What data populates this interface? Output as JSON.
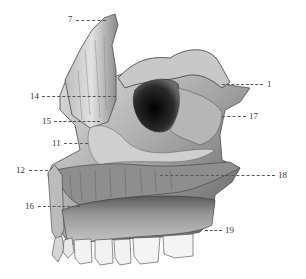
{
  "figure": {
    "colors": {
      "background": "#ffffff",
      "bone_light": "#d8d8d8",
      "bone_mid": "#9a9a9a",
      "bone_dark": "#3a3a3a",
      "cavity": "#111111",
      "teeth": "#f2f2f2",
      "label_text": "#333333",
      "leader": "#555555"
    }
  },
  "labels": [
    {
      "id": "7",
      "text": "7",
      "x": 68,
      "y": 15,
      "line_x1": 76,
      "line_x2": 106,
      "line_y": 20
    },
    {
      "id": "14",
      "text": "14",
      "x": 30,
      "y": 92,
      "line_x1": 42,
      "line_x2": 116,
      "line_y": 96
    },
    {
      "id": "15",
      "text": "15",
      "x": 42,
      "y": 117,
      "line_x1": 54,
      "line_x2": 100,
      "line_y": 121
    },
    {
      "id": "11",
      "text": "11",
      "x": 52,
      "y": 139,
      "line_x1": 64,
      "line_x2": 88,
      "line_y": 143
    },
    {
      "id": "12",
      "text": "12",
      "x": 16,
      "y": 166,
      "line_x1": 29,
      "line_x2": 48,
      "line_y": 170
    },
    {
      "id": "16",
      "text": "16",
      "x": 25,
      "y": 202,
      "line_x1": 38,
      "line_x2": 80,
      "line_y": 206
    },
    {
      "id": "1",
      "text": "1",
      "x": 267,
      "y": 80,
      "line_x1": 222,
      "line_x2": 263,
      "line_y": 84
    },
    {
      "id": "17",
      "text": "17",
      "x": 249,
      "y": 112,
      "line_x1": 222,
      "line_x2": 246,
      "line_y": 116
    },
    {
      "id": "18",
      "text": "18",
      "x": 278,
      "y": 171,
      "line_x1": 160,
      "line_x2": 275,
      "line_y": 175
    },
    {
      "id": "19",
      "text": "19",
      "x": 225,
      "y": 226,
      "line_x1": 205,
      "line_x2": 222,
      "line_y": 230
    }
  ]
}
